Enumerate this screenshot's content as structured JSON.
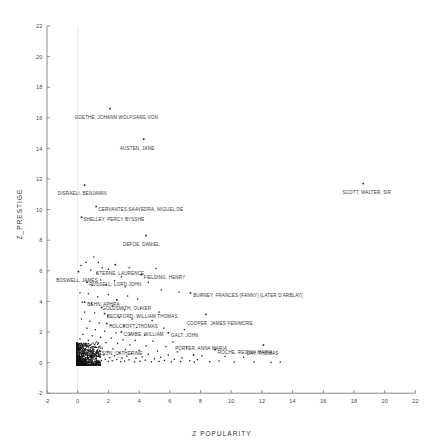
{
  "chart_data": {
    "type": "scatter",
    "title": "",
    "xlabel": "Z  POPULARITY",
    "ylabel": "Z_PRESTIGE",
    "xlim": [
      -2,
      22
    ],
    "ylim": [
      -2,
      22
    ],
    "xticks": [
      -2,
      0,
      2,
      4,
      6,
      8,
      10,
      12,
      14,
      16,
      18,
      20,
      22
    ],
    "yticks": [
      -2,
      0,
      2,
      4,
      6,
      8,
      10,
      12,
      14,
      16,
      18,
      20,
      22
    ],
    "grid": "vertical-at-x0",
    "legend": "none",
    "point_color": "#1d1d1d",
    "labeled_points": [
      {
        "label": "GOETHE, JOHANN WOLFGANG VON",
        "x": 2.1,
        "y": 16.6,
        "label_dx": -2.3,
        "label_dy": -0.45
      },
      {
        "label": "AUSTEN, JANE",
        "x": 4.3,
        "y": 14.6,
        "label_dx": -1.55,
        "label_dy": -0.45
      },
      {
        "label": "SCOTT, WALTER, SIR",
        "x": 18.6,
        "y": 11.7,
        "label_dx": -1.35,
        "label_dy": -0.45
      },
      {
        "label": "DISRAELI, BENJAMIN",
        "x": 0.45,
        "y": 11.6,
        "label_dx": -1.75,
        "label_dy": -0.45
      },
      {
        "label": "CERVANTES SAAVEDRA, MIGUEL DE",
        "x": 1.2,
        "y": 10.2,
        "label_dx": 0.15,
        "label_dy": -0.1
      },
      {
        "label": "SHELLEY, PERCY BYSSHE",
        "x": 0.25,
        "y": 9.5,
        "label_dx": 0.12,
        "label_dy": -0.05
      },
      {
        "label": "DEFOE, DANIEL",
        "x": 4.45,
        "y": 8.3,
        "label_dx": -1.5,
        "label_dy": -0.45
      },
      {
        "label": "STERNE, LAURENCE",
        "x": 2.45,
        "y": 6.4,
        "label_dx": -1.25,
        "label_dy": -0.45
      },
      {
        "label": "BOSWELL, JAMES",
        "x": 0.05,
        "y": 5.95,
        "label_dx": -1.45,
        "label_dy": -0.45
      },
      {
        "label": "FIELDING, HENRY",
        "x": 4.15,
        "y": 5.75,
        "label_dx": 0.15,
        "label_dy": -0.05
      },
      {
        "label": "RUSSELL, LORD JOHN",
        "x": 0.6,
        "y": 5.25,
        "label_dx": 0.15,
        "label_dy": -0.05
      },
      {
        "label": "BURNEY, FRANCES (FANNY) [LATER D'ARBLAY]",
        "x": 7.35,
        "y": 4.55,
        "label_dx": 0.18,
        "label_dy": -0.05
      },
      {
        "label": "BEHN, APHRA",
        "x": 0.45,
        "y": 3.95,
        "label_dx": 0.18,
        "label_dy": -0.05
      },
      {
        "label": "GOLDSMITH, OLIVER",
        "x": 2.55,
        "y": 4.1,
        "label_dx": -0.95,
        "label_dy": -0.45
      },
      {
        "label": "BECKFORD, WILLIAM THOMAS",
        "x": 1.75,
        "y": 3.2,
        "label_dx": 0.15,
        "label_dy": -0.05
      },
      {
        "label": "COOPER, JAMES FENIMORE",
        "x": 8.35,
        "y": 3.15,
        "label_dx": -1.25,
        "label_dy": -0.45
      },
      {
        "label": "HOLCROFT, THOMAS",
        "x": 1.9,
        "y": 2.55,
        "label_dx": 0.15,
        "label_dy": -0.05
      },
      {
        "label": "COMBE, WILLIAM",
        "x": 2.85,
        "y": 2.0,
        "label_dx": 0.15,
        "label_dy": -0.05
      },
      {
        "label": "GALT, JOHN",
        "x": 5.9,
        "y": 1.95,
        "label_dx": 0.18,
        "label_dy": -0.05
      },
      {
        "label": "ROCHE, REGINA MARIA",
        "x": 8.95,
        "y": 0.85,
        "label_dx": 0.18,
        "label_dy": -0.05
      },
      {
        "label": "DAY, THOMAS",
        "x": 12.1,
        "y": 1.15,
        "label_dx": -1.1,
        "label_dy": -0.45
      },
      {
        "label": "PORTER, ANNA MARIA",
        "x": 7.55,
        "y": 0.5,
        "label_dx": -1.2,
        "label_dy": 0.55
      },
      {
        "label": "CUTHBERTSON, CATHERINE",
        "x": 0.95,
        "y": 0.05,
        "label_dx": -1.05,
        "label_dy": 0.68
      }
    ],
    "unlabeled_points": [
      [
        0.22,
        6.35
      ],
      [
        0.55,
        6.55
      ],
      [
        1.05,
        6.9
      ],
      [
        1.35,
        6.55
      ],
      [
        1.6,
        6.2
      ],
      [
        0.85,
        6.05
      ],
      [
        1.25,
        5.85
      ],
      [
        2.0,
        6.1
      ],
      [
        2.85,
        5.6
      ],
      [
        3.35,
        6.2
      ],
      [
        5.1,
        6.15
      ],
      [
        1.5,
        5.4
      ],
      [
        0.95,
        5.05
      ],
      [
        1.85,
        5.1
      ],
      [
        2.4,
        5.35
      ],
      [
        3.1,
        4.95
      ],
      [
        4.6,
        5.25
      ],
      [
        5.45,
        4.75
      ],
      [
        6.6,
        4.6
      ],
      [
        0.15,
        4.55
      ],
      [
        0.7,
        4.5
      ],
      [
        1.3,
        4.3
      ],
      [
        2.0,
        4.45
      ],
      [
        3.25,
        4.35
      ],
      [
        3.9,
        4.15
      ],
      [
        0.3,
        3.95
      ],
      [
        0.9,
        3.85
      ],
      [
        1.55,
        3.6
      ],
      [
        2.25,
        3.7
      ],
      [
        3.05,
        3.45
      ],
      [
        4.1,
        3.55
      ],
      [
        5.3,
        3.3
      ],
      [
        0.45,
        3.3
      ],
      [
        1.1,
        3.25
      ],
      [
        1.95,
        3.05
      ],
      [
        2.7,
        2.95
      ],
      [
        3.55,
        2.85
      ],
      [
        4.85,
        2.75
      ],
      [
        0.25,
        2.85
      ],
      [
        0.8,
        2.7
      ],
      [
        1.4,
        2.6
      ],
      [
        2.15,
        2.45
      ],
      [
        3.0,
        2.4
      ],
      [
        3.85,
        2.3
      ],
      [
        5.6,
        2.25
      ],
      [
        6.95,
        2.15
      ],
      [
        0.6,
        2.25
      ],
      [
        1.15,
        2.15
      ],
      [
        1.75,
        2.05
      ],
      [
        2.5,
        1.95
      ],
      [
        3.4,
        1.85
      ],
      [
        4.35,
        1.8
      ],
      [
        0.35,
        1.85
      ],
      [
        0.95,
        1.75
      ],
      [
        1.5,
        1.65
      ],
      [
        2.2,
        1.6
      ],
      [
        2.95,
        1.5
      ],
      [
        3.75,
        1.45
      ],
      [
        4.9,
        1.4
      ],
      [
        6.2,
        1.35
      ],
      [
        0.15,
        1.55
      ],
      [
        0.7,
        1.45
      ],
      [
        1.25,
        1.35
      ],
      [
        1.85,
        1.3
      ],
      [
        2.6,
        1.25
      ],
      [
        3.4,
        1.15
      ],
      [
        4.45,
        1.1
      ],
      [
        5.75,
        1.05
      ],
      [
        7.1,
        0.95
      ],
      [
        0.45,
        1.15
      ],
      [
        1.0,
        1.05
      ],
      [
        1.6,
        0.95
      ],
      [
        2.3,
        0.9
      ],
      [
        3.1,
        0.85
      ],
      [
        4.0,
        0.8
      ],
      [
        5.2,
        0.75
      ],
      [
        6.5,
        0.7
      ],
      [
        0.2,
        0.9
      ],
      [
        0.75,
        0.82
      ],
      [
        1.3,
        0.75
      ],
      [
        1.95,
        0.7
      ],
      [
        2.7,
        0.65
      ],
      [
        3.5,
        0.6
      ],
      [
        4.6,
        0.55
      ],
      [
        5.9,
        0.5
      ],
      [
        8.1,
        0.45
      ],
      [
        9.6,
        0.4
      ],
      [
        10.8,
        0.35
      ],
      [
        0.55,
        0.6
      ],
      [
        1.1,
        0.55
      ],
      [
        1.7,
        0.5
      ],
      [
        2.4,
        0.45
      ],
      [
        3.2,
        0.42
      ],
      [
        4.2,
        0.38
      ],
      [
        5.4,
        0.35
      ],
      [
        6.8,
        0.3
      ],
      [
        0.3,
        0.45
      ],
      [
        0.85,
        0.4
      ],
      [
        1.45,
        0.35
      ],
      [
        2.1,
        0.32
      ],
      [
        2.9,
        0.3
      ],
      [
        3.8,
        0.28
      ],
      [
        5.0,
        0.25
      ],
      [
        6.3,
        0.22
      ],
      [
        7.8,
        0.2
      ],
      [
        0.1,
        0.3
      ],
      [
        0.65,
        0.28
      ],
      [
        1.2,
        0.25
      ],
      [
        1.8,
        0.22
      ],
      [
        2.55,
        0.2
      ],
      [
        3.35,
        0.18
      ],
      [
        4.4,
        0.16
      ],
      [
        5.65,
        0.14
      ],
      [
        7.3,
        0.12
      ],
      [
        9.2,
        0.1
      ],
      [
        0.4,
        0.18
      ],
      [
        0.95,
        0.16
      ],
      [
        1.55,
        0.14
      ],
      [
        2.25,
        0.12
      ],
      [
        3.05,
        0.1
      ],
      [
        4.05,
        0.09
      ],
      [
        5.3,
        0.08
      ],
      [
        6.7,
        0.07
      ],
      [
        8.6,
        0.06
      ],
      [
        11.5,
        0.05
      ],
      [
        13.2,
        0.04
      ],
      [
        0.18,
        0.1
      ],
      [
        0.72,
        0.09
      ],
      [
        1.35,
        0.08
      ],
      [
        2.0,
        0.07
      ],
      [
        2.8,
        0.06
      ],
      [
        3.7,
        0.05
      ],
      [
        4.8,
        0.05
      ],
      [
        6.1,
        0.04
      ],
      [
        7.6,
        0.03
      ],
      [
        10.2,
        0.03
      ],
      [
        12.6,
        0.02
      ]
    ]
  },
  "axes": {
    "x_tick_labels": [
      "-2",
      "0",
      "2",
      "4",
      "6",
      "8",
      "10",
      "12",
      "14",
      "16",
      "18",
      "20",
      "22"
    ],
    "y_tick_labels": [
      "22",
      "20",
      "18",
      "16",
      "14",
      "12",
      "10",
      "8",
      "6",
      "4",
      "2",
      "0",
      "-2"
    ]
  }
}
